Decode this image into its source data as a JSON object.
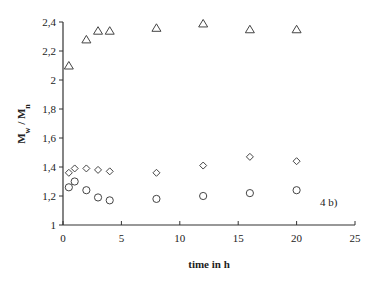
{
  "chart_data": {
    "type": "scatter",
    "title": "",
    "xlabel": "time in h",
    "ylabel": "M_w / M_n",
    "ylabel_main": "M",
    "ylabel_sub1": "w",
    "ylabel_sep": " / M",
    "ylabel_sub2": "n",
    "xlim": [
      0,
      25
    ],
    "ylim": [
      1,
      2.4
    ],
    "xticks": [
      0,
      5,
      10,
      15,
      20,
      25
    ],
    "xtick_labels": [
      "0",
      "5",
      "10",
      "15",
      "20",
      "25"
    ],
    "yticks": [
      1,
      1.2,
      1.4,
      1.6,
      1.8,
      2,
      2.2,
      2.4
    ],
    "ytick_labels": [
      "1",
      "1,2",
      "1,4",
      "1,6",
      "1,8",
      "2",
      "2,2",
      "2,4"
    ],
    "grid": false,
    "legend": null,
    "annotation": "4 b)",
    "series": [
      {
        "name": "triangles",
        "marker": "triangle",
        "x": [
          0.5,
          2,
          3,
          4,
          8,
          12,
          16,
          20
        ],
        "y": [
          2.1,
          2.28,
          2.34,
          2.34,
          2.36,
          2.39,
          2.35,
          2.35
        ]
      },
      {
        "name": "diamonds",
        "marker": "diamond",
        "x": [
          0.5,
          1,
          2,
          3,
          4,
          8,
          12,
          16,
          20
        ],
        "y": [
          1.36,
          1.39,
          1.39,
          1.38,
          1.37,
          1.36,
          1.41,
          1.47,
          1.44
        ]
      },
      {
        "name": "circles",
        "marker": "circle",
        "x": [
          0.5,
          1,
          2,
          3,
          4,
          8,
          12,
          16,
          20
        ],
        "y": [
          1.26,
          1.3,
          1.24,
          1.19,
          1.17,
          1.18,
          1.2,
          1.22,
          1.24
        ]
      }
    ]
  }
}
